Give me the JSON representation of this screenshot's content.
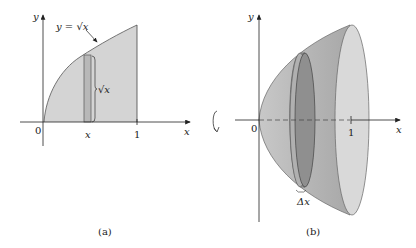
{
  "panel_a": {
    "caption": "(a)",
    "y_axis_label": "y",
    "x_axis_label": "x",
    "origin_label": "0",
    "tick_one_label": "1",
    "strip_x_label": "x",
    "curve_label": "y = √x",
    "strip_height_label": "√x",
    "region_fill": "#d4d4d4",
    "strip_fill": "#b8b8b8"
  },
  "panel_b": {
    "caption": "(b)",
    "y_axis_label": "y",
    "x_axis_label": "x",
    "origin_label": "0",
    "tick_one_label": "1",
    "disk_thickness_label": "Δx",
    "rotation_icon": "rotation-arrow-icon",
    "solid_fill": "#bdbdbd",
    "disk_fill": "#8f8f8f",
    "end_cap_fill": "#d9d9d9"
  }
}
